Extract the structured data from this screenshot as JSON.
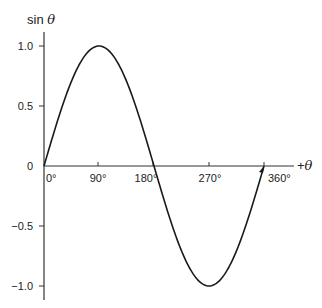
{
  "chart_data": {
    "type": "line",
    "title": "",
    "xlabel": "+θ",
    "ylabel": "sin θ",
    "x_ticks": [
      "0°",
      "90°",
      "180°",
      "270°",
      "360°"
    ],
    "y_ticks": [
      "1.0",
      "0.5",
      "0",
      "−0.5",
      "−1.0"
    ],
    "xlim": [
      0,
      360
    ],
    "ylim": [
      -1.0,
      1.0
    ],
    "grid": false,
    "series": [
      {
        "name": "sin θ",
        "x": [
          0,
          45,
          90,
          135,
          180,
          225,
          270,
          315,
          360
        ],
        "values": [
          0,
          0.707,
          1.0,
          0.707,
          0,
          -0.707,
          -1.0,
          -0.707,
          0
        ]
      }
    ]
  },
  "labels": {
    "ylabel_text": "sin ",
    "ylabel_var": "θ",
    "xlabel_sign": "+",
    "xlabel_var": "θ"
  }
}
